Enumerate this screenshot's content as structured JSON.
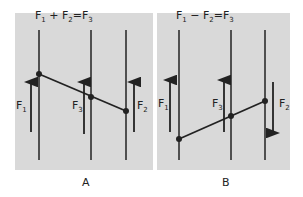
{
  "panels": [
    {
      "id": "A",
      "caption": "A",
      "equation": {
        "f1": "F",
        "s1": "1",
        "op": "+",
        "f2": "F",
        "s2": "2",
        "eq": "=",
        "f3": "F",
        "s3": "3"
      },
      "labels": {
        "f1": "F",
        "f1_sub": "1",
        "f3": "F",
        "f3_sub": "3",
        "f2": "F",
        "f2_sub": "2"
      },
      "description": "Two parallel forces in same direction: F1 + F2 = F3"
    },
    {
      "id": "B",
      "caption": "B",
      "equation": {
        "f1": "F",
        "s1": "1",
        "op": "−",
        "f2": "F",
        "s2": "2",
        "eq": "=",
        "f3": "F",
        "s3": "3"
      },
      "labels": {
        "f1": "F",
        "f1_sub": "1",
        "f3": "F",
        "f3_sub": "3",
        "f2": "F",
        "f2_sub": "2"
      },
      "description": "Two parallel forces in opposite directions: F1 − F2 = F3"
    }
  ],
  "colors": {
    "panel_bg": "#d9d9d9",
    "ink": "#222222",
    "page_bg": "#ffffff"
  }
}
